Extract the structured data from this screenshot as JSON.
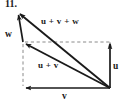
{
  "figure": {
    "item_number": "11.",
    "labels": {
      "w": "w",
      "u": "u",
      "v": "v",
      "u_plus_v": "u + v",
      "u_plus_v_plus_w": "u + v + w"
    },
    "colors": {
      "stroke": "#1a1a1a",
      "dashed": "#8a8a8a",
      "background": "#ffffff",
      "text": "#1a1a1a"
    },
    "geometry": {
      "apex": [
        17,
        11
      ],
      "left_vertex": [
        23,
        42
      ],
      "bottom_left": [
        23,
        88
      ],
      "origin": [
        110,
        88
      ],
      "top_right": [
        110,
        42
      ]
    },
    "vectors": [
      {
        "name": "u",
        "from": [
          110,
          88
        ],
        "to": [
          110,
          42
        ],
        "style": "solid"
      },
      {
        "name": "v",
        "from": [
          110,
          88
        ],
        "to": [
          23,
          88
        ],
        "style": "solid"
      },
      {
        "name": "u + v",
        "from": [
          110,
          88
        ],
        "to": [
          23,
          42
        ],
        "style": "solid"
      },
      {
        "name": "u + v + w",
        "from": [
          110,
          88
        ],
        "to": [
          17,
          11
        ],
        "style": "solid"
      },
      {
        "name": "w",
        "from": [
          23,
          42
        ],
        "to": [
          17,
          11
        ],
        "style": "solid"
      }
    ],
    "guides": [
      {
        "name": "horizontal-dashed",
        "from": [
          23,
          42
        ],
        "to": [
          110,
          42
        ]
      },
      {
        "name": "vertical-dashed",
        "from": [
          23,
          42
        ],
        "to": [
          23,
          88
        ]
      }
    ]
  }
}
